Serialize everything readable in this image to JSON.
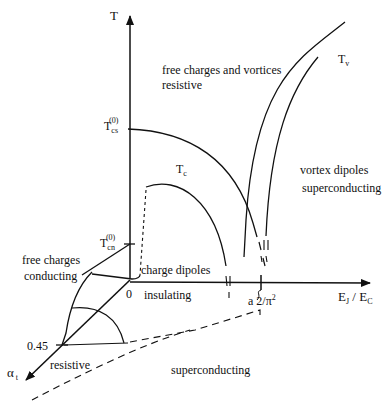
{
  "figure": {
    "type": "phase-diagram",
    "axes": {
      "vertical": {
        "label": "T"
      },
      "horizontal": {
        "label": "E_J / E_C",
        "label_main1": "E",
        "label_sub1": "J",
        "label_sep": " / ",
        "label_main2": "E",
        "label_sub2": "C"
      },
      "depth": {
        "label": "α_t",
        "label_main": "α",
        "label_sub": "t"
      }
    },
    "tick_labels": {
      "origin": "0",
      "alpha_tick": "0.45",
      "x_tick": "a 2/π²",
      "x_tick_main": "a 2/π",
      "x_tick_sup": "2",
      "tcs": {
        "main": "T",
        "sub": "cs",
        "sup": "(0)"
      },
      "tcn": {
        "main": "T",
        "sub": "cn",
        "sup": "(0)"
      }
    },
    "curve_labels": {
      "tc": {
        "main": "T",
        "sub": "c"
      },
      "tv": {
        "main": "T",
        "sub": "v"
      }
    },
    "region_labels": {
      "top_line1": "free charges and vortices",
      "top_line2": "resistive",
      "right_line1": "vortex dipoles",
      "right_line2": "superconducting",
      "left_line1": "free charges",
      "left_line2": "conducting",
      "center_upper": "charge dipoles",
      "center_lower": "insulating",
      "bottom_left": "resistive",
      "bottom_right": "superconducting"
    },
    "colors": {
      "ink": "#111111",
      "background": "#ffffff"
    }
  }
}
